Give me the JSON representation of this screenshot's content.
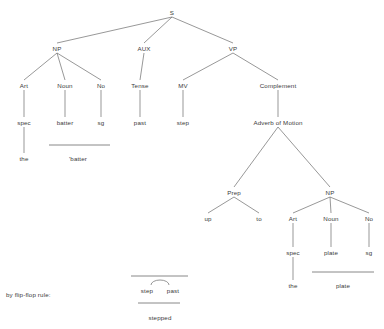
{
  "diagram": {
    "title_text": "",
    "type": "syntax-tree",
    "line_color": "#6b6b6b",
    "text_color": "#3a3a3a",
    "background": "#ffffff",
    "nodes": [
      {
        "id": "S",
        "label": "S",
        "x": 172,
        "y": 12
      },
      {
        "id": "NP1",
        "label": "NP",
        "x": 57,
        "y": 48
      },
      {
        "id": "AUX",
        "label": "AUX",
        "x": 144,
        "y": 48
      },
      {
        "id": "VP",
        "label": "VP",
        "x": 233,
        "y": 48
      },
      {
        "id": "Art1",
        "label": "Art",
        "x": 24,
        "y": 85
      },
      {
        "id": "Noun1",
        "label": "Noun",
        "x": 65,
        "y": 85
      },
      {
        "id": "No1",
        "label": "No",
        "x": 101,
        "y": 85
      },
      {
        "id": "Tense",
        "label": "Tense",
        "x": 140,
        "y": 85
      },
      {
        "id": "MV",
        "label": "MV",
        "x": 183,
        "y": 85
      },
      {
        "id": "Complement",
        "label": "Complement",
        "x": 278,
        "y": 85
      },
      {
        "id": "spec1",
        "label": "spec",
        "x": 24,
        "y": 122
      },
      {
        "id": "batter1",
        "label": "batter",
        "x": 65,
        "y": 122
      },
      {
        "id": "sg1",
        "label": "sg",
        "x": 101,
        "y": 122
      },
      {
        "id": "past",
        "label": "past",
        "x": 140,
        "y": 122
      },
      {
        "id": "step",
        "label": "step",
        "x": 183,
        "y": 122
      },
      {
        "id": "advmotion",
        "label": "Adverb of Motion",
        "x": 278,
        "y": 122
      },
      {
        "id": "the1",
        "label": "the",
        "x": 24,
        "y": 158
      },
      {
        "id": "batterForm",
        "label": "'batter",
        "x": 78,
        "y": 158
      },
      {
        "id": "Prep",
        "label": "Prep",
        "x": 234,
        "y": 192
      },
      {
        "id": "NP2",
        "label": "NP",
        "x": 330,
        "y": 192
      },
      {
        "id": "up",
        "label": "up",
        "x": 208,
        "y": 218
      },
      {
        "id": "to",
        "label": "to",
        "x": 259,
        "y": 218
      },
      {
        "id": "Art2",
        "label": "Art",
        "x": 293,
        "y": 218
      },
      {
        "id": "Noun2",
        "label": "Noun",
        "x": 331,
        "y": 218
      },
      {
        "id": "No2",
        "label": "No",
        "x": 369,
        "y": 218
      },
      {
        "id": "spec2",
        "label": "spec",
        "x": 293,
        "y": 252
      },
      {
        "id": "plate1",
        "label": "plate",
        "x": 331,
        "y": 252
      },
      {
        "id": "sg2",
        "label": "sg",
        "x": 369,
        "y": 252
      },
      {
        "id": "the2",
        "label": "the",
        "x": 293,
        "y": 285
      },
      {
        "id": "plateForm",
        "label": "plate",
        "x": 343,
        "y": 285
      }
    ],
    "edges": [
      {
        "from": "S",
        "to": "NP1"
      },
      {
        "from": "S",
        "to": "AUX"
      },
      {
        "from": "S",
        "to": "VP"
      },
      {
        "from": "NP1",
        "to": "Art1"
      },
      {
        "from": "NP1",
        "to": "Noun1"
      },
      {
        "from": "NP1",
        "to": "No1"
      },
      {
        "from": "AUX",
        "to": "Tense"
      },
      {
        "from": "VP",
        "to": "MV"
      },
      {
        "from": "VP",
        "to": "Complement"
      },
      {
        "from": "Art1",
        "to": "spec1"
      },
      {
        "from": "Noun1",
        "to": "batter1"
      },
      {
        "from": "No1",
        "to": "sg1"
      },
      {
        "from": "Tense",
        "to": "past"
      },
      {
        "from": "MV",
        "to": "step"
      },
      {
        "from": "Complement",
        "to": "advmotion"
      },
      {
        "from": "spec1",
        "to": "the1"
      },
      {
        "from": "advmotion",
        "to": "Prep"
      },
      {
        "from": "advmotion",
        "to": "NP2"
      },
      {
        "from": "Prep",
        "to": "up"
      },
      {
        "from": "Prep",
        "to": "to"
      },
      {
        "from": "NP2",
        "to": "Art2"
      },
      {
        "from": "NP2",
        "to": "Noun2"
      },
      {
        "from": "NP2",
        "to": "No2"
      },
      {
        "from": "Art2",
        "to": "spec2"
      },
      {
        "from": "Noun2",
        "to": "plate1"
      },
      {
        "from": "No2",
        "to": "sg2"
      },
      {
        "from": "spec2",
        "to": "the2"
      }
    ],
    "morph_bars": [
      {
        "id": "bar-batter",
        "x1": 49,
        "x2": 110,
        "y": 145
      },
      {
        "id": "bar-plate",
        "x1": 312,
        "x2": 374,
        "y": 272
      }
    ]
  },
  "flip_flop": {
    "caption": "by flip-flop rule:",
    "caption_x": 6,
    "caption_y": 291,
    "top_bar": {
      "x1": 131,
      "x2": 188,
      "y": 276
    },
    "bottom_bar": {
      "x1": 138,
      "x2": 180,
      "y": 303
    },
    "left_token": {
      "label": "step",
      "x": 147,
      "y": 290
    },
    "right_token": {
      "label": "past",
      "x": 173,
      "y": 290
    },
    "result": {
      "label": "stepped",
      "x": 160,
      "y": 317
    },
    "arc": {
      "cx": 160,
      "cy": 285,
      "rx": 9,
      "ry": 5
    }
  }
}
